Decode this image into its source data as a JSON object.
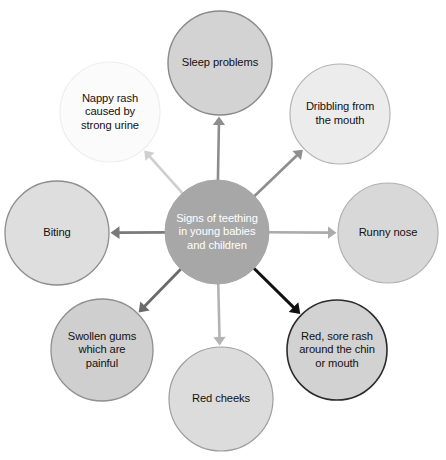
{
  "diagram": {
    "type": "spider-diagram",
    "center": {
      "id": "center",
      "label": "Signs of teething in young babies and children",
      "lines": [
        "Signs of teething",
        "in young babies",
        "and children"
      ],
      "cx": 217,
      "cy": 232,
      "r": 52,
      "fill": "#a7a7a7",
      "stroke": "#a7a7a7",
      "stroke_width": 1,
      "text_color": "#ffffff"
    },
    "nodes": [
      {
        "id": "sleep-problems",
        "label": "Sleep problems",
        "lines": [
          "Sleep problems"
        ],
        "cx": 220,
        "cy": 63,
        "r": 52,
        "fill": "#d3d3d3",
        "stroke": "#8a8a8a",
        "stroke_width": 1.4,
        "text_color": "#15110f",
        "direction": "top"
      },
      {
        "id": "dribbling-from-the-mouth",
        "label": "Dribbling from the mouth",
        "lines": [
          "Dribbling from",
          "the mouth"
        ],
        "cx": 340,
        "cy": 114,
        "r": 50,
        "fill": "#ececec",
        "stroke": "#b4b4b4",
        "stroke_width": 1.2,
        "text_color": "#15110f",
        "direction": "top-right"
      },
      {
        "id": "runny-nose",
        "label": "Runny nose",
        "lines": [
          "Runny nose"
        ],
        "cx": 388,
        "cy": 233,
        "r": 50,
        "fill": "#d8d8d8",
        "stroke": "#b0b0b0",
        "stroke_width": 1.2,
        "text_color": "#15110f",
        "direction": "right"
      },
      {
        "id": "red-sore-rash",
        "label": "Red, sore rash around the chin or mouth",
        "lines": [
          "Red, sore rash",
          "around the chin",
          "or mouth"
        ],
        "cx": 337,
        "cy": 350,
        "r": 50,
        "fill": "#d2d2d2",
        "stroke": "#2b2b2b",
        "stroke_width": 1.6,
        "text_color": "#15110f",
        "direction": "bottom-right"
      },
      {
        "id": "red-cheeks",
        "label": "Red cheeks",
        "lines": [
          "Red cheeks"
        ],
        "cx": 221,
        "cy": 399,
        "r": 52,
        "fill": "#dcdcdc",
        "stroke": "#9e9e9e",
        "stroke_width": 1.2,
        "text_color": "#15110f",
        "direction": "bottom"
      },
      {
        "id": "swollen-gums",
        "label": "Swollen gums which are painful",
        "lines": [
          "Swollen gums",
          "which are",
          "painful"
        ],
        "cx": 102,
        "cy": 350,
        "r": 51,
        "fill": "#cfcfcf",
        "stroke": "#8f8f8f",
        "stroke_width": 1.3,
        "text_color": "#15110f",
        "direction": "bottom-left"
      },
      {
        "id": "biting",
        "label": "Biting",
        "lines": [
          "Biting"
        ],
        "cx": 57,
        "cy": 233,
        "r": 52,
        "fill": "#dedede",
        "stroke": "#8d8d8d",
        "stroke_width": 1.3,
        "text_color": "#15110f",
        "direction": "left"
      },
      {
        "id": "nappy-rash",
        "label": "Nappy rash caused by strong urine",
        "lines": [
          "Nappy rash",
          "caused by",
          "strong urine"
        ],
        "cx": 110,
        "cy": 112,
        "r": 50,
        "fill": "#fbfbfb",
        "stroke": "#eeeeee",
        "stroke_width": 1.2,
        "text_color": "#15110f",
        "direction": "top-left"
      }
    ],
    "arrows": [
      {
        "id": "arrow-to-sleep-problems",
        "to": "sleep-problems",
        "color": "#8d8d8d",
        "width": 2.6,
        "head": 8.5
      },
      {
        "id": "arrow-to-dribbling",
        "to": "dribbling-from-the-mouth",
        "color": "#8e8e8e",
        "width": 2.6,
        "head": 8.5
      },
      {
        "id": "arrow-to-runny-nose",
        "to": "runny-nose",
        "color": "#ababab",
        "width": 2.6,
        "head": 8.5
      },
      {
        "id": "arrow-to-red-sore-rash",
        "to": "red-sore-rash",
        "color": "#111111",
        "width": 3.0,
        "head": 9.5
      },
      {
        "id": "arrow-to-red-cheeks",
        "to": "red-cheeks",
        "color": "#b3b3b3",
        "width": 2.6,
        "head": 8.5
      },
      {
        "id": "arrow-to-swollen-gums",
        "to": "swollen-gums",
        "color": "#6a6a6a",
        "width": 2.8,
        "head": 9.0
      },
      {
        "id": "arrow-to-biting",
        "to": "biting",
        "color": "#7a7a7a",
        "width": 2.8,
        "head": 9.0
      },
      {
        "id": "arrow-to-nappy-rash",
        "to": "nappy-rash",
        "color": "#cfcfcf",
        "width": 2.6,
        "head": 8.5
      }
    ],
    "background": "#ffffff"
  }
}
